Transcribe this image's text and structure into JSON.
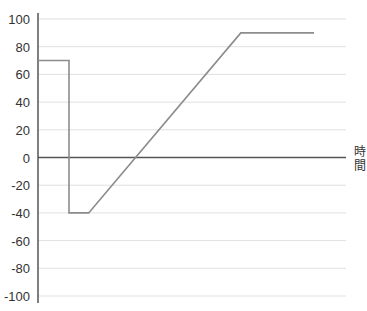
{
  "chart_data": {
    "type": "line",
    "title": "",
    "xlabel": "時間",
    "ylabel": "",
    "ylim": [
      -100,
      100
    ],
    "yticks": [
      "100",
      "80",
      "60",
      "40",
      "20",
      "0",
      "-20",
      "-40",
      "-60",
      "-80",
      "-100"
    ],
    "grid": true,
    "legend": null,
    "series": [
      {
        "name": "value",
        "color": "#8c8c8c",
        "points": [
          {
            "x": 0,
            "y": 70
          },
          {
            "x": 11,
            "y": 70
          },
          {
            "x": 11,
            "y": -40
          },
          {
            "x": 18,
            "y": -40
          },
          {
            "x": 72,
            "y": 90
          },
          {
            "x": 98,
            "y": 90
          }
        ]
      }
    ],
    "x_unit_note": "x in relative units (0-110 across plot width)"
  },
  "colors": {
    "axis": "#555555",
    "grid": "#e0e0e0",
    "line": "#8c8c8c"
  }
}
